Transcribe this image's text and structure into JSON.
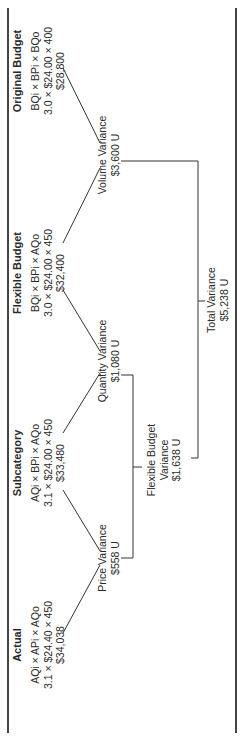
{
  "diagram": {
    "orientation": "rotated-90-ccw",
    "columns": [
      {
        "title": "Actual",
        "formula": "AQi × APi × AQo",
        "values": "3.1 × $24.40 × 450",
        "total": "$34,038"
      },
      {
        "title": "Subcategory",
        "formula": "AQi × BPi × AQo",
        "values": "3.1 × $24.00 × 450",
        "total": "$33,480"
      },
      {
        "title": "Flexible Budget",
        "formula": "BQi × BPi × AQo",
        "values": "3.0 × $24.00 × 450",
        "total": "$32,400"
      },
      {
        "title": "Original Budget",
        "formula": "BQi × BPi × BQo",
        "values": "3.0 × $24.00 × 400",
        "total": "$28,800"
      }
    ],
    "variances": {
      "price": {
        "label": "Price Variance",
        "amount": "$558 U"
      },
      "quantity": {
        "label": "Quantity Variance",
        "amount": "$1,080 U"
      },
      "volume": {
        "label": "Volume Variance",
        "amount": "$3,600 U"
      },
      "flexible_budget": {
        "label_line1": "Flexible Budget",
        "label_line2": "Variance",
        "amount": "$1,638 U"
      },
      "total": {
        "label": "Total Variance",
        "amount": "$5,238 U"
      }
    }
  }
}
